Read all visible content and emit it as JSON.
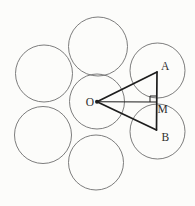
{
  "figure": {
    "colors": {
      "background": "#fcfcfa",
      "circle_stroke": "#6e6e6e",
      "triangle_stroke": "#1d1d1d",
      "label_color": "#2e2e2e"
    },
    "circles": [
      {
        "name": "top",
        "cx": 98,
        "cy": 46.5,
        "r": 29.5,
        "stroke_width": 0.9
      },
      {
        "name": "upper-left",
        "cx": 44,
        "cy": 73.5,
        "r": 28.5,
        "stroke_width": 0.9
      },
      {
        "name": "upper-right",
        "cx": 157.5,
        "cy": 70.5,
        "r": 27.5,
        "stroke_width": 0.9
      },
      {
        "name": "central",
        "cx": 97,
        "cy": 101.5,
        "r": 27.5,
        "stroke_width": 0.9
      },
      {
        "name": "lower-left",
        "cx": 43,
        "cy": 135,
        "r": 28.5,
        "stroke_width": 0.9
      },
      {
        "name": "lower-right",
        "cx": 157.5,
        "cy": 131.5,
        "r": 27.5,
        "stroke_width": 0.9
      },
      {
        "name": "bottom",
        "cx": 96,
        "cy": 162.5,
        "r": 27.5,
        "stroke_width": 0.9
      }
    ],
    "points": {
      "O": [
        97,
        101.8
      ],
      "A": [
        157,
        72
      ],
      "B": [
        156.5,
        130
      ],
      "M": [
        156,
        102
      ]
    },
    "segments": [
      {
        "from": "O",
        "to": "A",
        "width": 1.7
      },
      {
        "from": "O",
        "to": "B",
        "width": 1.7
      },
      {
        "from": "A",
        "to": "B",
        "width": 1.7
      },
      {
        "from": "O",
        "to": "M",
        "width": 1.1
      }
    ],
    "right_angle_marker": {
      "at": "M",
      "size": 6,
      "width": 1
    },
    "center_dot": {
      "point": "O",
      "radius": 2
    },
    "labels": [
      {
        "text": "O",
        "x": 94,
        "y": 105.5,
        "anchor": "end"
      },
      {
        "text": "A",
        "x": 161,
        "y": 70,
        "anchor": "start"
      },
      {
        "text": "M",
        "x": 157.5,
        "y": 113,
        "anchor": "start"
      },
      {
        "text": "B",
        "x": 161.5,
        "y": 141,
        "anchor": "start"
      }
    ]
  }
}
